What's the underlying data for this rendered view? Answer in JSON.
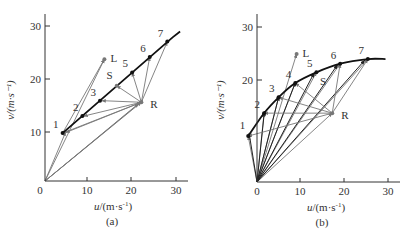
{
  "chart_data": [
    {
      "type": "scatter",
      "caption": "(a)",
      "xlabel": "u/(m·s⁻¹)",
      "ylabel": "v/(m·s⁻¹)",
      "xlim": [
        0,
        33
      ],
      "ylim": [
        0,
        33
      ],
      "xticks": [
        0,
        10,
        20,
        30
      ],
      "yticks": [
        10,
        20,
        30
      ],
      "curve": {
        "name": "state-line",
        "points": [
          [
            4,
            9
          ],
          [
            29,
            27
          ]
        ],
        "extend_to": [
          30.7,
          28.1
        ]
      },
      "points": [
        {
          "label": "1",
          "u": 4,
          "v": 9
        },
        {
          "label": "2",
          "u": 8.5,
          "v": 12.2
        },
        {
          "label": "3",
          "u": 12.5,
          "v": 15.1
        },
        {
          "label": "S",
          "u": 16.3,
          "v": 17.9
        },
        {
          "label": "5",
          "u": 19.8,
          "v": 20.4
        },
        {
          "label": "6",
          "u": 23.8,
          "v": 23.3
        },
        {
          "label": "7",
          "u": 27.8,
          "v": 26.2
        }
      ],
      "L": {
        "label": "L",
        "u": 13.5,
        "v": 22.9
      },
      "R": {
        "label": "R",
        "u": 21.9,
        "v": 14.8
      },
      "vectors_from_origin": [
        [
          4.7,
          9.2
        ],
        [
          13.5,
          22.9
        ],
        [
          21.3,
          14.5
        ],
        [
          21.9,
          14.8
        ],
        [
          22.2,
          15.2
        ]
      ],
      "vectors_from_R": [
        [
          4.7,
          9.1
        ],
        [
          8.8,
          12.2
        ],
        [
          12.9,
          15.1
        ],
        [
          16.3,
          17.9
        ],
        [
          19.8,
          20.4
        ],
        [
          23.8,
          23.3
        ],
        [
          27.8,
          26.2
        ]
      ],
      "vectors_from_1": [
        [
          13.5,
          22.9
        ],
        [
          21.9,
          14.8
        ]
      ]
    },
    {
      "type": "scatter",
      "caption": "(b)",
      "xlabel": "u/(m·s⁻¹)",
      "ylabel": "v/(m·s⁻¹)",
      "xlim": [
        -2,
        33
      ],
      "ylim": [
        0,
        33
      ],
      "xticks": [
        0,
        10,
        20,
        30
      ],
      "yticks": [
        20,
        30
      ],
      "curve": {
        "name": "state-curve",
        "points": [
          [
            -2,
            9
          ],
          [
            1.6,
            13.5
          ],
          [
            4.9,
            16.6
          ],
          [
            8.7,
            19.4
          ],
          [
            13.5,
            21.5
          ],
          [
            18.9,
            23.2
          ],
          [
            25.2,
            24.1
          ],
          [
            29.2,
            24.1
          ]
        ]
      },
      "points": [
        {
          "label": "1",
          "u": -2,
          "v": 9
        },
        {
          "label": "2",
          "u": 1.6,
          "v": 13.5
        },
        {
          "label": "3",
          "u": 4.9,
          "v": 16.6
        },
        {
          "label": "4",
          "u": 8.7,
          "v": 19.4
        },
        {
          "label": "5",
          "u": 13.5,
          "v": 21.5
        },
        {
          "label": "6",
          "u": 18.9,
          "v": 23.2
        },
        {
          "label": "7",
          "u": 25.2,
          "v": 24.1
        }
      ],
      "L": {
        "label": "L",
        "u": 9.0,
        "v": 25.1
      },
      "R": {
        "label": "R",
        "u": 17.1,
        "v": 13.5
      },
      "S_label": {
        "label": "S",
        "u": 14.3,
        "v": 19.1
      },
      "vectors_from_origin": [
        [
          -2,
          9
        ],
        [
          1.6,
          13.5
        ],
        [
          4.9,
          16.6
        ],
        [
          8.7,
          19.4
        ],
        [
          9.0,
          25.1
        ],
        [
          13.5,
          21.5
        ],
        [
          18.9,
          23.2
        ],
        [
          25.2,
          24.1
        ],
        [
          17.1,
          13.5
        ]
      ],
      "vectors_from_R": [
        [
          -2,
          9
        ],
        [
          1.6,
          13.5
        ],
        [
          4.9,
          16.6
        ],
        [
          8.7,
          19.4
        ],
        [
          18.9,
          23.2
        ],
        [
          25.2,
          24.1
        ]
      ],
      "extra_from_origin_to_near_points": [
        [
          -1.8,
          9.6
        ],
        [
          1.7,
          13.9
        ],
        [
          5.0,
          16.9
        ],
        [
          8.8,
          19.7
        ],
        [
          13.0,
          21.4
        ],
        [
          18.3,
          23.0
        ],
        [
          24.5,
          23.9
        ]
      ]
    }
  ],
  "labels": {
    "a": {
      "caption": "(a)",
      "xlabel_u": "u",
      "xlabel_units": "/(m·s",
      "xlabel_exp": "-1",
      "xlabel_close": ")",
      "ylabel": "v/(m·s⁻¹)",
      "origin": "0",
      "ticks_x": [
        "10",
        "20",
        "30"
      ],
      "ticks_y": [
        "10",
        "20",
        "30"
      ]
    },
    "b": {
      "caption": "(b)",
      "xlabel_u": "u",
      "xlabel_units": "/(m·s",
      "xlabel_exp": "-1",
      "xlabel_close": ")",
      "ylabel": "v/(m·s⁻¹)",
      "origin": "0",
      "ticks_x": [
        "10",
        "20",
        "30"
      ],
      "ticks_y": [
        "20",
        "30"
      ]
    }
  }
}
